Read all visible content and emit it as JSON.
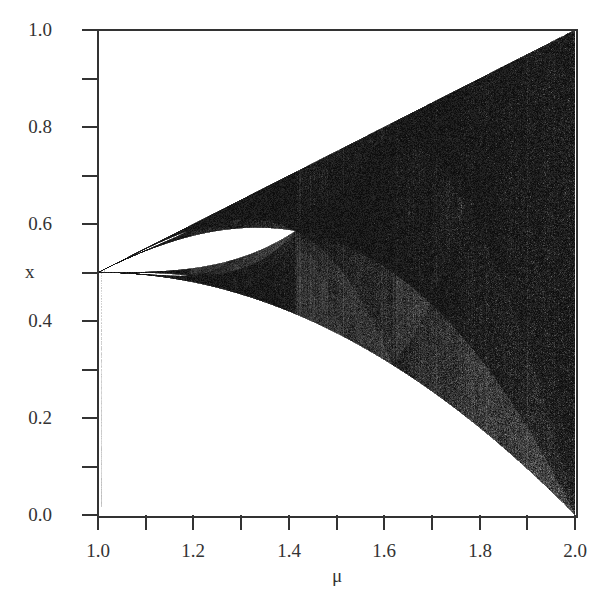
{
  "chart_data": {
    "type": "scatter",
    "title": "",
    "xlabel": "μ",
    "ylabel": "x",
    "xlim": [
      1.0,
      2.0
    ],
    "ylim": [
      0.0,
      1.0
    ],
    "x_ticks": [
      "1.0",
      "1.2",
      "1.4",
      "1.6",
      "1.8",
      "2.0"
    ],
    "y_ticks": [
      "0.0",
      "0.2",
      "0.4",
      "0.6",
      "0.8",
      "1.0"
    ],
    "minor_tick_step": 0.1,
    "grid": false,
    "legend": null,
    "upper_boundary": {
      "formula": "x = μ/2",
      "x": [
        1.0,
        1.2,
        1.4,
        1.6,
        1.8,
        2.0
      ],
      "y": [
        0.5,
        0.6,
        0.7,
        0.8,
        0.9,
        1.0
      ]
    },
    "lower_boundary": {
      "formula": "x = μ(1 - μ/2)",
      "x": [
        1.0,
        1.2,
        1.4,
        1.6,
        1.8,
        2.0
      ],
      "y": [
        0.5,
        0.48,
        0.42,
        0.32,
        0.18,
        0.0
      ]
    },
    "band_merging_point": {
      "mu": 1.414,
      "x": 0.586
    },
    "gap_region": {
      "mu_range": [
        1.0,
        1.414
      ],
      "upper_edge_formula": "x = μ²(1-μ/2)",
      "lower_edge_formula": "x = μ/(1+μ)"
    },
    "colors": {
      "dense": "#1a1a1a",
      "sparse": "#d0d0d0",
      "background": "#ffffff",
      "axis": "#333333"
    }
  }
}
